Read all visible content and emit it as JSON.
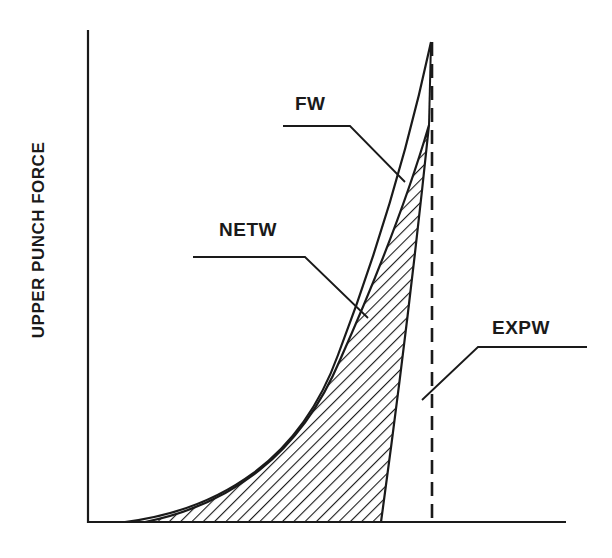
{
  "diagram": {
    "y_axis_label": "UPPER PUNCH FORCE",
    "labels": {
      "fw": "FW",
      "netw": "NETW",
      "expw": "EXPW"
    },
    "colors": {
      "ink": "#1a1a1a",
      "background": "#ffffff"
    }
  }
}
